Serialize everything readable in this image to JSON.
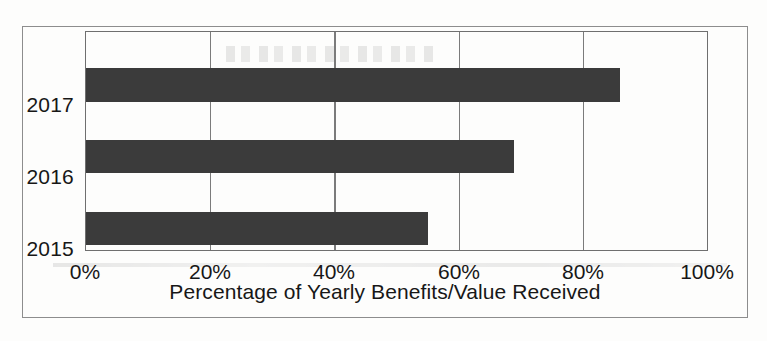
{
  "chart_data": {
    "type": "bar",
    "orientation": "horizontal",
    "title": "",
    "categories": [
      "2017",
      "2016",
      "2015"
    ],
    "values": [
      86,
      69,
      55
    ],
    "series": [
      {
        "name": "Percentage of Yearly Benefits/Value Received",
        "values": [
          86,
          69,
          55
        ]
      }
    ],
    "xlabel": "Percentage of Yearly Benefits/Value Received",
    "ylabel": "",
    "xlim": [
      0,
      100
    ],
    "xticks": [
      0,
      20,
      40,
      60,
      80,
      100
    ],
    "xtick_labels": [
      "0%",
      "20%",
      "40%",
      "60%",
      "80%",
      "100%"
    ],
    "ytick_labels": [
      "2017",
      "2016",
      "2015"
    ],
    "grid": "vertical",
    "legend": "none",
    "bar_color": "#3b3b3b",
    "axis_color": "#6f6f6f",
    "background_color": "#fdfdfc"
  },
  "figure": {
    "x_axis_title": "Percentage of Yearly Benefits/Value Received",
    "caption": ""
  },
  "bars": [
    {
      "category": "2017",
      "value": 86,
      "value_label": "86%"
    },
    {
      "category": "2016",
      "value": 69,
      "value_label": "69%"
    },
    {
      "category": "2015",
      "value": 55,
      "value_label": "55%"
    }
  ],
  "x_ticks": [
    {
      "label": "0%",
      "value": 0
    },
    {
      "label": "20%",
      "value": 20
    },
    {
      "label": "40%",
      "value": 40
    },
    {
      "label": "60%",
      "value": 60
    },
    {
      "label": "80%",
      "value": 80
    },
    {
      "label": "100%",
      "value": 100
    }
  ]
}
